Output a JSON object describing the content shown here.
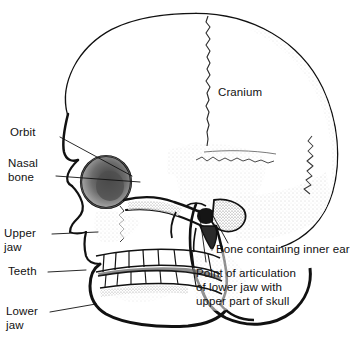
{
  "figure": {
    "background_color": "#ffffff",
    "ink_color": "#111111",
    "label_font_size_px": 11.5
  },
  "labels": {
    "cranium": "Cranium",
    "orbit": "Orbit",
    "nasal_bone_line1": "Nasal",
    "nasal_bone_line2": "bone",
    "upper_jaw_line1": "Upper",
    "upper_jaw_line2": "jaw",
    "teeth": "Teeth",
    "lower_jaw_line1": "Lower",
    "lower_jaw_line2": "jaw",
    "inner_ear": "Bone containing inner ear",
    "articulation_line1": "Point of articulation",
    "articulation_line2": "of lower jaw with",
    "articulation_line3": "upper part of skull"
  }
}
